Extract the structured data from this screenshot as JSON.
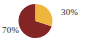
{
  "figure": {
    "background_color": "#ffffff",
    "label_color": "#222222"
  },
  "chart_data": {
    "type": "pie",
    "title": "",
    "subtitle": "",
    "xlabel": "",
    "ylabel": "",
    "grid": false,
    "legend_position": "none",
    "start_angle_deg": 90,
    "direction": "clockwise",
    "center": {
      "x": 35.5,
      "y": 21
    },
    "radius": 17,
    "categories": [
      "30%",
      "70%"
    ],
    "values": [
      30,
      70
    ],
    "colors": [
      "#efb63e",
      "#832525"
    ],
    "slices": [
      {
        "label": "30%",
        "value": 30,
        "color": "#efb63e",
        "start_angle_deg": 0,
        "end_angle_deg": 108,
        "label_position": "right"
      },
      {
        "label": "70%",
        "value": 70,
        "color": "#832525",
        "start_angle_deg": 108,
        "end_angle_deg": 360,
        "label_position": "left"
      }
    ],
    "annotations": [
      {
        "text": "30%",
        "x": 61,
        "y": 7
      },
      {
        "text": "70%",
        "x": 2,
        "y": 25
      }
    ]
  }
}
